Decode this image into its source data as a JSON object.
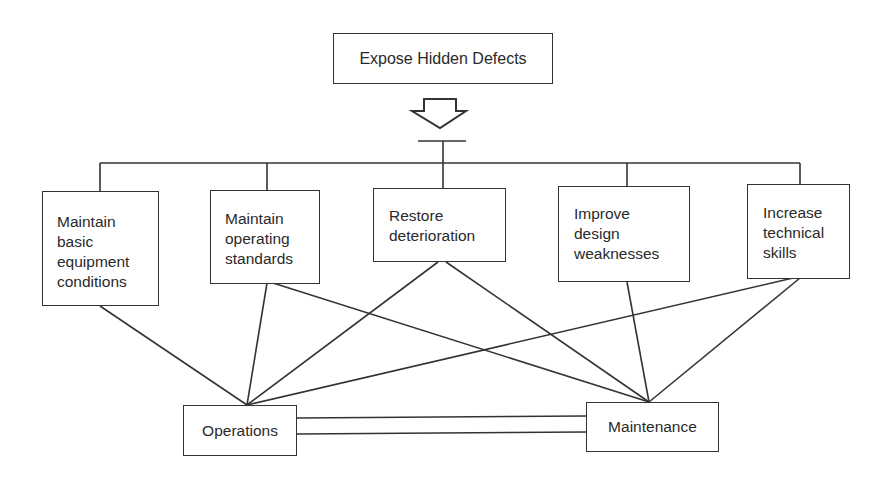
{
  "diagram": {
    "top": {
      "label": "Expose Hidden Defects"
    },
    "activities": [
      {
        "label": "Maintain\nbasic\nequipment\nconditions"
      },
      {
        "label": "Maintain\noperating\nstandards"
      },
      {
        "label": "Restore\ndeterioration"
      },
      {
        "label": "Improve\ndesign\nweaknesses"
      },
      {
        "label": "Increase\ntechnical\nskills"
      }
    ],
    "departments": [
      {
        "label": "Operations"
      },
      {
        "label": "Maintenance"
      }
    ],
    "colors": {
      "stroke": "#333333",
      "text": "#2a2a2a",
      "background": "#ffffff"
    }
  }
}
